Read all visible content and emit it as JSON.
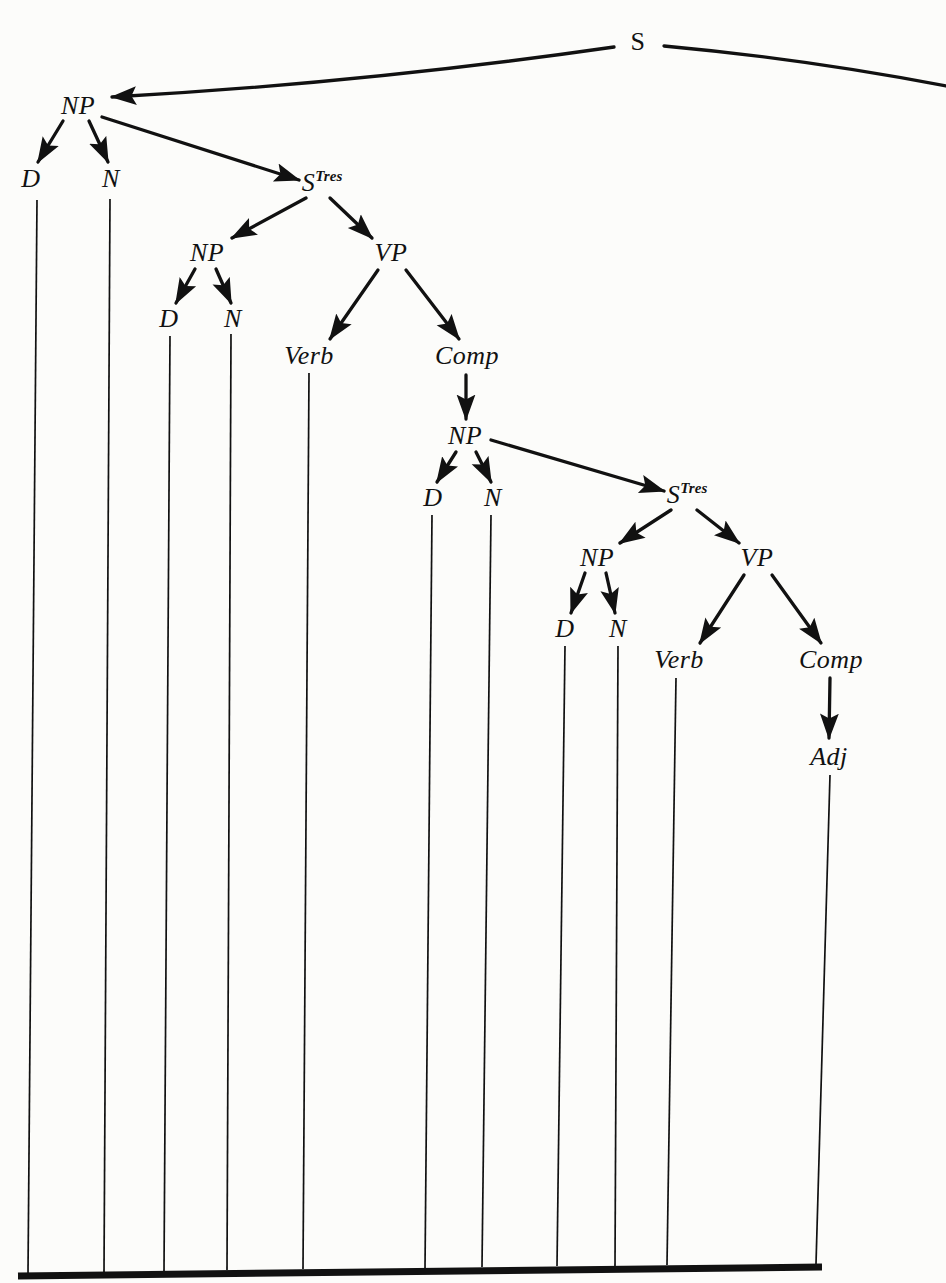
{
  "figure": {
    "kind": "syntactic-derivation-tree",
    "canvas": {
      "width": 946,
      "height": 1283
    },
    "ink_color": "#111111",
    "background_color": "#fcfcfa"
  },
  "nodes": [
    {
      "id": "s-root",
      "label": "S",
      "sup": "",
      "style": "roman",
      "x": 638,
      "y": 42
    },
    {
      "id": "np-1",
      "label": "NP",
      "sup": "",
      "style": "italic",
      "x": 78,
      "y": 106
    },
    {
      "id": "d-1",
      "label": "D",
      "sup": "",
      "style": "italic",
      "x": 31,
      "y": 179
    },
    {
      "id": "n-1",
      "label": "N",
      "sup": "",
      "style": "italic",
      "x": 111,
      "y": 179
    },
    {
      "id": "stres-1",
      "label": "S",
      "sup": "Tres",
      "style": "italic",
      "x": 322,
      "y": 183
    },
    {
      "id": "np-2",
      "label": "NP",
      "sup": "",
      "style": "italic",
      "x": 207,
      "y": 253
    },
    {
      "id": "vp-1",
      "label": "VP",
      "sup": "",
      "style": "italic",
      "x": 391,
      "y": 253
    },
    {
      "id": "d-2",
      "label": "D",
      "sup": "",
      "style": "italic",
      "x": 169,
      "y": 319
    },
    {
      "id": "n-2",
      "label": "N",
      "sup": "",
      "style": "italic",
      "x": 233,
      "y": 319
    },
    {
      "id": "verb-1",
      "label": "Verb",
      "sup": "",
      "style": "italic",
      "x": 309,
      "y": 356
    },
    {
      "id": "comp-1",
      "label": "Comp",
      "sup": "",
      "style": "italic",
      "x": 467,
      "y": 356
    },
    {
      "id": "np-3",
      "label": "NP",
      "sup": "",
      "style": "italic",
      "x": 465,
      "y": 436
    },
    {
      "id": "d-3",
      "label": "D",
      "sup": "",
      "style": "italic",
      "x": 433,
      "y": 498
    },
    {
      "id": "n-3",
      "label": "N",
      "sup": "",
      "style": "italic",
      "x": 493,
      "y": 498
    },
    {
      "id": "stres-2",
      "label": "S",
      "sup": "Tres",
      "style": "italic",
      "x": 687,
      "y": 495
    },
    {
      "id": "np-4",
      "label": "NP",
      "sup": "",
      "style": "italic",
      "x": 597,
      "y": 558
    },
    {
      "id": "vp-2",
      "label": "VP",
      "sup": "",
      "style": "italic",
      "x": 757,
      "y": 558
    },
    {
      "id": "d-4",
      "label": "D",
      "sup": "",
      "style": "italic",
      "x": 565,
      "y": 629
    },
    {
      "id": "n-4",
      "label": "N",
      "sup": "",
      "style": "italic",
      "x": 618,
      "y": 629
    },
    {
      "id": "verb-2",
      "label": "Verb",
      "sup": "",
      "style": "italic",
      "x": 679,
      "y": 660
    },
    {
      "id": "comp-2",
      "label": "Comp",
      "sup": "",
      "style": "italic",
      "x": 831,
      "y": 660
    },
    {
      "id": "adj-1",
      "label": "Adj",
      "sup": "",
      "style": "italic",
      "x": 829,
      "y": 757
    }
  ],
  "arrows": [
    {
      "id": "s-to-np1",
      "from": "s-root",
      "to": "np-1",
      "x1": 614,
      "y1": 47,
      "x2": 112,
      "y2": 97,
      "bow": -11
    },
    {
      "id": "s-to-right",
      "from": "s-root",
      "to": "offpage",
      "x1": 664,
      "y1": 46,
      "x2": 946,
      "y2": 86,
      "bow": -7,
      "head": false
    },
    {
      "id": "np1-to-d1",
      "from": "np-1",
      "to": "d-1",
      "x1": 63,
      "y1": 121,
      "x2": 38,
      "y2": 162
    },
    {
      "id": "np1-to-n1",
      "from": "np-1",
      "to": "n-1",
      "x1": 89,
      "y1": 121,
      "x2": 108,
      "y2": 162
    },
    {
      "id": "np1-to-stres1",
      "from": "np-1",
      "to": "stres-1",
      "x1": 102,
      "y1": 117,
      "x2": 299,
      "y2": 180
    },
    {
      "id": "stres1-to-np2",
      "from": "stres-1",
      "to": "np-2",
      "x1": 306,
      "y1": 198,
      "x2": 232,
      "y2": 238
    },
    {
      "id": "stres1-to-vp1",
      "from": "stres-1",
      "to": "vp-1",
      "x1": 330,
      "y1": 198,
      "x2": 372,
      "y2": 238
    },
    {
      "id": "np2-to-d2",
      "from": "np-2",
      "to": "d-2",
      "x1": 195,
      "y1": 269,
      "x2": 176,
      "y2": 303
    },
    {
      "id": "np2-to-n2",
      "from": "np-2",
      "to": "n-2",
      "x1": 216,
      "y1": 269,
      "x2": 231,
      "y2": 303
    },
    {
      "id": "vp1-to-verb1",
      "from": "vp-1",
      "to": "verb-1",
      "x1": 378,
      "y1": 270,
      "x2": 330,
      "y2": 339
    },
    {
      "id": "vp1-to-comp1",
      "from": "vp-1",
      "to": "comp-1",
      "x1": 406,
      "y1": 270,
      "x2": 459,
      "y2": 339
    },
    {
      "id": "comp1-to-np3",
      "from": "comp-1",
      "to": "np-3",
      "x1": 466,
      "y1": 375,
      "x2": 466,
      "y2": 419
    },
    {
      "id": "np3-to-d3",
      "from": "np-3",
      "to": "d-3",
      "x1": 456,
      "y1": 452,
      "x2": 437,
      "y2": 482
    },
    {
      "id": "np3-to-n3",
      "from": "np-3",
      "to": "n-3",
      "x1": 476,
      "y1": 452,
      "x2": 491,
      "y2": 482
    },
    {
      "id": "np3-to-stres2",
      "from": "np-3",
      "to": "stres-2",
      "x1": 491,
      "y1": 440,
      "x2": 664,
      "y2": 491
    },
    {
      "id": "stres2-to-np4",
      "from": "stres-2",
      "to": "np-4",
      "x1": 671,
      "y1": 510,
      "x2": 620,
      "y2": 543
    },
    {
      "id": "stres2-to-vp4",
      "from": "stres-2",
      "to": "vp-2",
      "x1": 697,
      "y1": 510,
      "x2": 739,
      "y2": 543
    },
    {
      "id": "np4-to-d4",
      "from": "np-4",
      "to": "d-4",
      "x1": 585,
      "y1": 573,
      "x2": 571,
      "y2": 613
    },
    {
      "id": "np4-to-n4",
      "from": "np-4",
      "to": "n-4",
      "x1": 606,
      "y1": 573,
      "x2": 615,
      "y2": 613
    },
    {
      "id": "vp2-to-verb2",
      "from": "vp-2",
      "to": "verb-2",
      "x1": 744,
      "y1": 575,
      "x2": 700,
      "y2": 643
    },
    {
      "id": "vp2-to-comp2",
      "from": "vp-2",
      "to": "comp-2",
      "x1": 772,
      "y1": 575,
      "x2": 821,
      "y2": 643
    },
    {
      "id": "comp2-to-adj1",
      "from": "comp-2",
      "to": "adj-1",
      "x1": 830,
      "y1": 678,
      "x2": 829,
      "y2": 738
    }
  ],
  "leaf_lines": [
    {
      "id": "leaf-d1",
      "from": "d-1",
      "x1": 37,
      "y1": 200,
      "x2": 28,
      "y2": 1274
    },
    {
      "id": "leaf-n1",
      "from": "n-1",
      "x1": 110,
      "y1": 199,
      "x2": 104,
      "y2": 1272
    },
    {
      "id": "leaf-d2",
      "from": "d-2",
      "x1": 170,
      "y1": 336,
      "x2": 164,
      "y2": 1271
    },
    {
      "id": "leaf-n2",
      "from": "n-2",
      "x1": 231,
      "y1": 334,
      "x2": 227,
      "y2": 1270
    },
    {
      "id": "leaf-verb1",
      "from": "verb-1",
      "x1": 309,
      "y1": 373,
      "x2": 303,
      "y2": 1269
    },
    {
      "id": "leaf-d3",
      "from": "d-3",
      "x1": 432,
      "y1": 515,
      "x2": 425,
      "y2": 1268
    },
    {
      "id": "leaf-n3",
      "from": "n-3",
      "x1": 491,
      "y1": 515,
      "x2": 482,
      "y2": 1267
    },
    {
      "id": "leaf-d4",
      "from": "d-4",
      "x1": 565,
      "y1": 646,
      "x2": 557,
      "y2": 1266
    },
    {
      "id": "leaf-n4",
      "from": "n-4",
      "x1": 618,
      "y1": 646,
      "x2": 615,
      "y2": 1266
    },
    {
      "id": "leaf-verb2",
      "from": "verb-2",
      "x1": 676,
      "y1": 678,
      "x2": 667,
      "y2": 1265
    },
    {
      "id": "leaf-adj1",
      "from": "adj-1",
      "x1": 830,
      "y1": 775,
      "x2": 816,
      "y2": 1264
    }
  ],
  "baseline": {
    "id": "terminal-baseline",
    "x1": 18,
    "y1": 1276,
    "x2": 822,
    "y2": 1267,
    "thickness": 7
  }
}
